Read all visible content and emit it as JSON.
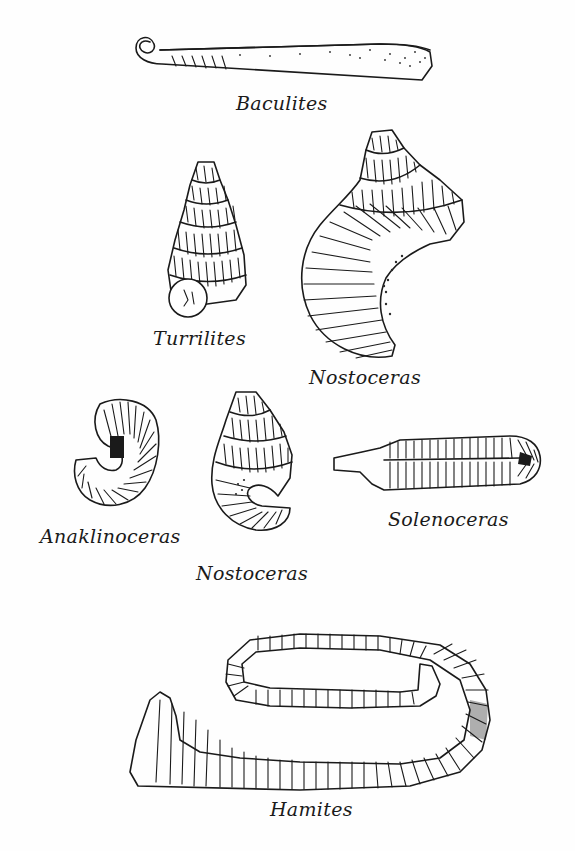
{
  "plate": {
    "description": "Illustration plate of heteromorph ammonite fossils",
    "background": "#fefefe",
    "ink_color": "#1a1a1a"
  },
  "specimens": [
    {
      "id": "baculites",
      "label": "Baculites",
      "form": "straight shaft with small initial coil"
    },
    {
      "id": "turrilites",
      "label": "Turrilites",
      "form": "tall helical spire"
    },
    {
      "id": "nostoceras_large",
      "label": "Nostoceras",
      "form": "helical spire ending in U-shaped hook"
    },
    {
      "id": "anaklinoceras",
      "label": "Anaklinoceras",
      "form": "small hooked coil"
    },
    {
      "id": "nostoceras_small",
      "label": "Nostoceras",
      "form": "small helical spire with hook"
    },
    {
      "id": "solenoceras",
      "label": "Solenoceras",
      "form": "elongate hairpin shaft"
    },
    {
      "id": "hamites",
      "label": "Hamites",
      "form": "large open hairpin loop"
    }
  ]
}
